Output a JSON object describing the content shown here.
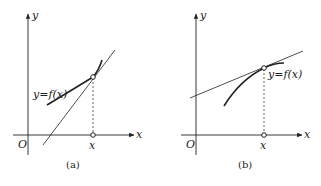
{
  "panels": [
    {
      "id": "a",
      "caption": "(a)",
      "origin_label": "O",
      "x_axis_label": "x",
      "y_axis_label": "y",
      "point_label": "x",
      "curve_label": "y=f(x)",
      "description": "Convex increasing curve with tangent line steeper, lying below curve"
    },
    {
      "id": "b",
      "caption": "(b)",
      "origin_label": "O",
      "x_axis_label": "x",
      "y_axis_label": "y",
      "point_label": "x",
      "curve_label": "y=f(x)",
      "description": "Concave increasing curve with tangent line lying above curve"
    }
  ],
  "colors": {
    "stroke": "#222222",
    "background": "#ffffff"
  }
}
